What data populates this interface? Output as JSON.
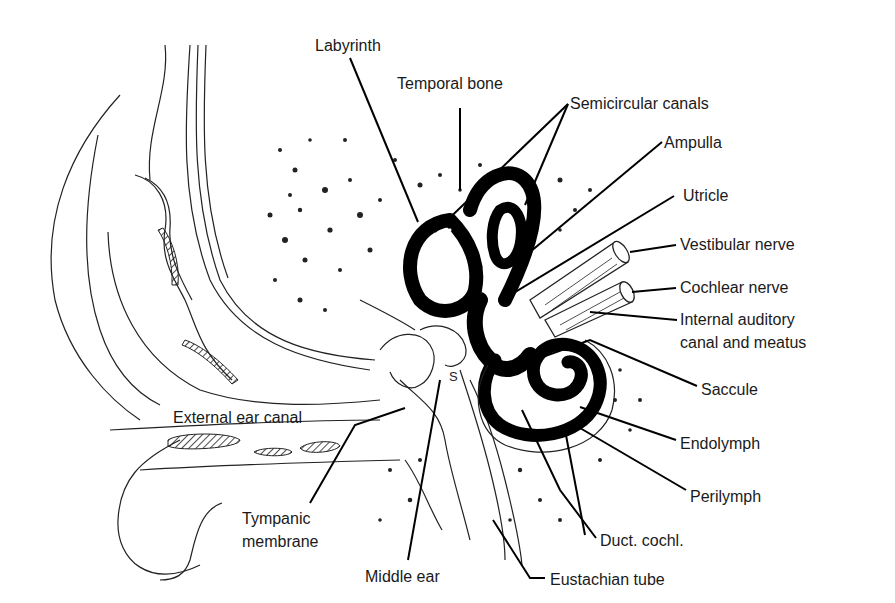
{
  "diagram": {
    "type": "anatomical-illustration",
    "labels": [
      {
        "id": "labyrinth",
        "text": "Labyrinth",
        "x": 315,
        "y": 36
      },
      {
        "id": "temporal-bone",
        "text": "Temporal bone",
        "x": 397,
        "y": 74
      },
      {
        "id": "semicircular-canals",
        "text": "Semicircular canals",
        "x": 570,
        "y": 94
      },
      {
        "id": "ampulla",
        "text": "Ampulla",
        "x": 664,
        "y": 133
      },
      {
        "id": "utricle",
        "text": "Utricle",
        "x": 683,
        "y": 186
      },
      {
        "id": "vestibular-nerve",
        "text": "Vestibular nerve",
        "x": 680,
        "y": 235
      },
      {
        "id": "cochlear-nerve",
        "text": "Cochlear nerve",
        "x": 680,
        "y": 278
      },
      {
        "id": "internal-auditory-canal",
        "text": "Internal auditory",
        "text2": "canal and meatus",
        "x": 680,
        "y": 310
      },
      {
        "id": "saccule",
        "text": "Saccule",
        "x": 701,
        "y": 380
      },
      {
        "id": "endolymph",
        "text": "Endolymph",
        "x": 680,
        "y": 434
      },
      {
        "id": "perilymph",
        "text": "Perilymph",
        "x": 690,
        "y": 487
      },
      {
        "id": "duct-cochl",
        "text": "Duct. cochl.",
        "x": 600,
        "y": 531
      },
      {
        "id": "eustachian-tube",
        "text": "Eustachian tube",
        "x": 550,
        "y": 570
      },
      {
        "id": "middle-ear",
        "text": "Middle ear",
        "x": 365,
        "y": 567
      },
      {
        "id": "tympanic-membrane",
        "text": "Tympanic",
        "text2": "membrane",
        "x": 242,
        "y": 509
      },
      {
        "id": "external-ear-canal",
        "text": "External ear canal",
        "x": 173,
        "y": 408
      }
    ],
    "annotation_marks": [
      {
        "id": "stapes-mark",
        "text": "S",
        "x": 455,
        "y": 368
      }
    ]
  }
}
